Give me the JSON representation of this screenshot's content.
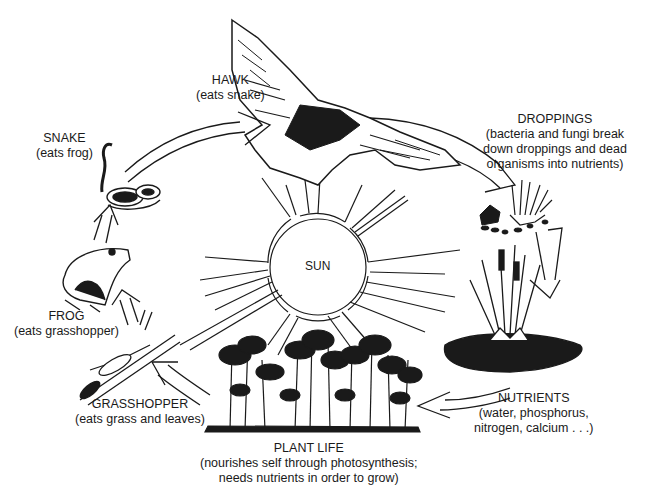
{
  "diagram": {
    "type": "food-cycle",
    "center": {
      "label": "SUN"
    },
    "nodes": [
      {
        "id": "hawk",
        "title": "HAWK",
        "desc": [
          "(eats snake)"
        ]
      },
      {
        "id": "droppings",
        "title": "DROPPINGS",
        "desc": [
          "(bacteria and fungi break",
          "down droppings and dead",
          "organisms into nutrients)"
        ]
      },
      {
        "id": "nutrients",
        "title": "NUTRIENTS",
        "desc": [
          "(water, phosphorus,",
          "nitrogen, calcium . . .)"
        ]
      },
      {
        "id": "plant_life",
        "title": "PLANT LIFE",
        "desc": [
          "(nourishes self through photosynthesis;",
          "needs nutrients in order to grow)"
        ]
      },
      {
        "id": "grasshopper",
        "title": "GRASSHOPPER",
        "desc": [
          "(eats grass and leaves)"
        ]
      },
      {
        "id": "frog",
        "title": "FROG",
        "desc": [
          "(eats grasshopper)"
        ]
      },
      {
        "id": "snake",
        "title": "SNAKE",
        "desc": [
          "(eats frog)"
        ]
      }
    ],
    "flow": [
      "hawk",
      "droppings",
      "nutrients",
      "plant_life",
      "grasshopper",
      "frog",
      "snake",
      "hawk"
    ],
    "icons": [
      "hawk-illustration",
      "pond-droppings-illustration",
      "cattail-pond-illustration",
      "plants-illustration",
      "grasshopper-illustration",
      "frog-illustration",
      "snake-illustration",
      "sun-icon"
    ],
    "colors": {
      "ink": "#1a1a1a",
      "background": "#ffffff"
    }
  }
}
